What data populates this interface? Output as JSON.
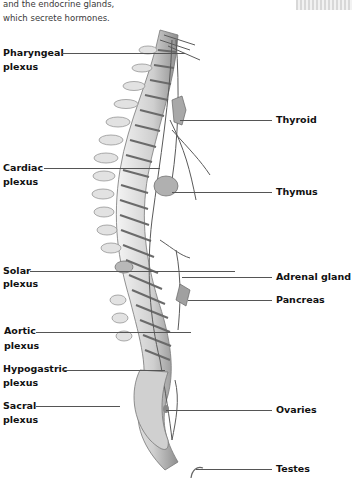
{
  "intro_text": {
    "line1": "and the endocrine glands,",
    "line2": "which secrete hormones."
  },
  "left_labels": [
    {
      "title": "Pharyngeal",
      "sub": "plexus"
    },
    {
      "title": "Cardiac",
      "sub": "plexus"
    },
    {
      "title": "Solar",
      "sub": "plexus"
    },
    {
      "title": "Aortic",
      "sub": "plexus"
    },
    {
      "title": "Hypogastric",
      "sub": "plexus"
    },
    {
      "title": "Sacral",
      "sub": "plexus"
    }
  ],
  "right_labels": [
    {
      "title": "Thyroid"
    },
    {
      "title": "Thymus"
    },
    {
      "title": "Adrenal gland"
    },
    {
      "title": "Pancreas"
    },
    {
      "title": "Ovaries"
    },
    {
      "title": "Testes"
    }
  ],
  "colors": {
    "label_text": "#111111",
    "leader_line": "#555555",
    "bone": "#c8c8c8",
    "gland": "#9a9a9a"
  }
}
